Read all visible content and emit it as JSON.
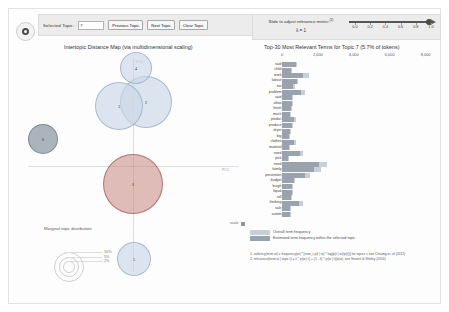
{
  "gutter": {
    "icon": "record-circle-icon"
  },
  "topic_controls": {
    "label": "Selected Topic:",
    "input_value": "7",
    "input_placeholder": "",
    "previous_label": "Previous Topic",
    "next_label": "Next Topic",
    "clear_label": "Clear Topic"
  },
  "lambda_controls": {
    "title": "Slide to adjust relevance metric:",
    "title_sup": "(2)",
    "value_label": "λ = 1",
    "ticks": [
      "0.0",
      "0.2",
      "0.4",
      "0.6",
      "0.8",
      "1.0"
    ],
    "handle_position_pct": 100
  },
  "mds": {
    "title": "Intertopic Distance Map (via multidimensional scaling)",
    "pc1_label": "PC1",
    "pc2_label": "PC2",
    "bubbles": [
      {
        "id": "1",
        "cx": 107,
        "cy": 130,
        "r": 30,
        "style": "sel"
      },
      {
        "id": "2",
        "cx": 120,
        "cy": 48,
        "r": 26,
        "style": "plain"
      },
      {
        "id": "3",
        "cx": 93,
        "cy": 52,
        "r": 24,
        "style": "plain"
      },
      {
        "id": "4",
        "cx": 110,
        "cy": 14,
        "r": 16,
        "style": "plain"
      },
      {
        "id": "5",
        "cx": 108,
        "cy": 205,
        "r": 17,
        "style": "plain"
      },
      {
        "id": "6",
        "cx": 17,
        "cy": 85,
        "r": 15,
        "style": "dark"
      }
    ]
  },
  "marginal": {
    "title": "Marginal topic distribution",
    "levels": [
      {
        "label": "2%",
        "r": 5
      },
      {
        "label": "5%",
        "r": 9
      },
      {
        "label": "10%",
        "r": 14
      }
    ]
  },
  "legend": {
    "marker_label": "scale",
    "overall_label": "Overall term frequency",
    "estimated_label": "Estimated term frequency within the selected topic"
  },
  "footnotes": [
    "1. saliency(term w) = frequency(w) * [sum_t p(t | w) * log(p(t | w)/p(t))] for topics t; see Chuang et. al (2012)",
    "2. relevance(term w | topic t) = λ * p(w | t) + (1 - λ) * p(w | t)/p(w); see Sievert & Shirley (2014)"
  ],
  "chart_data": {
    "type": "bar",
    "title": "Top-30 Most Relevant Terms for Topic 7 (5.7% of tokens)",
    "xlabel": "",
    "ylabel": "",
    "xlim": [
      0,
      8800
    ],
    "xticks": [
      0,
      2000,
      4000,
      6000,
      8000
    ],
    "xtick_labels": [
      "0",
      "2,000",
      "4,000",
      "6,000",
      "8,000"
    ],
    "grid": false,
    "legend_position": "bottom-left",
    "series": [
      {
        "name": "Overall term frequency",
        "color": "#c9cfd6"
      },
      {
        "name": "Estimated term frequency within the selected topic",
        "color": "#9aa3ad"
      }
    ],
    "categories": [
      "said",
      "child",
      "work",
      "labour",
      "eat",
      "problem",
      "said",
      "allow",
      "finish",
      "much",
      "predict",
      "produce",
      "dryer",
      "big",
      "clothes",
      "material",
      "need",
      "pick",
      "need",
      "family",
      "prevention",
      "budget",
      "burgh",
      "liquid",
      "roll",
      "thinking",
      "sale",
      "autom"
    ],
    "overall_values": [
      820,
      560,
      1480,
      900,
      700,
      1260,
      640,
      600,
      560,
      520,
      760,
      640,
      480,
      440,
      760,
      420,
      1180,
      400,
      2480,
      2160,
      1540,
      720,
      640,
      600,
      560,
      1160,
      520,
      480
    ],
    "topic_values": [
      760,
      500,
      1180,
      820,
      640,
      1040,
      580,
      540,
      500,
      470,
      660,
      580,
      430,
      400,
      660,
      380,
      980,
      360,
      2080,
      1800,
      1300,
      650,
      580,
      540,
      500,
      960,
      470,
      430
    ]
  }
}
